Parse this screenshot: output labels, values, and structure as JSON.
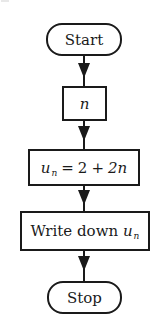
{
  "diagram": {
    "type": "flowchart",
    "direction": "top-to-bottom",
    "nodes": [
      {
        "id": "start",
        "shape": "terminal",
        "label": "Start"
      },
      {
        "id": "input",
        "shape": "process",
        "label": "n"
      },
      {
        "id": "compute",
        "shape": "process",
        "label": "u_n = 2 + 2n",
        "parts": {
          "var": "u",
          "sub": "n",
          "eq": "=",
          "const": "2",
          "plus": "+",
          "term": "2n"
        }
      },
      {
        "id": "output",
        "shape": "process",
        "label": "Write down u_n",
        "parts": {
          "text": "Write down",
          "var": "u",
          "sub": "n"
        }
      },
      {
        "id": "stop",
        "shape": "terminal",
        "label": "Stop"
      }
    ],
    "edges": [
      {
        "from": "start",
        "to": "input"
      },
      {
        "from": "input",
        "to": "compute"
      },
      {
        "from": "compute",
        "to": "output"
      },
      {
        "from": "output",
        "to": "stop"
      }
    ]
  },
  "colors": {
    "stroke": "#1a1a1a",
    "background": "#ffffff"
  }
}
